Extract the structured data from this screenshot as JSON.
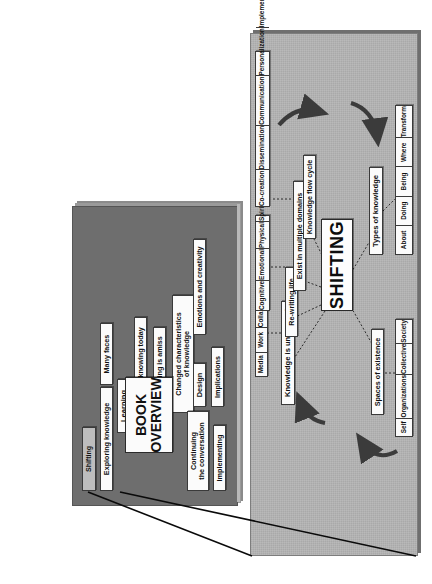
{
  "figure": {
    "type": "slide-zoom-callout",
    "orientation": "rotated-90-ccw",
    "colors": {
      "slide1_background": "#6e6e6e",
      "slide2_background": "#a9a9a9",
      "box_fill": "#fbfbfb",
      "highlight_fill": "#bdbdbd",
      "arrow": "#3a3a3a",
      "callout_line": "#0a0a0a",
      "page_background": "#ffffff"
    }
  },
  "slide_overview": {
    "title_line1": "BOOK",
    "title_line2": "OVERVIEW",
    "highlighted_item": "Shifting",
    "items_top": [
      "Exploring knowledge",
      "Many faces",
      "Learning",
      "In relation to knowing today",
      "Something is amiss"
    ],
    "item_changed_line1": "Changed characteristics",
    "item_changed_line2": "of knowledge",
    "items_bottom": [
      "Continuing",
      "the conversation",
      "Implementing",
      "Design",
      "Implications",
      "Emotions and creativity"
    ],
    "item_continuing_line1": "Continuing",
    "item_continuing_line2": "the conversation",
    "item_implementing": "Implementing",
    "item_design": "Design",
    "item_implications": "Implications",
    "item_emotions": "Emotions and creativity"
  },
  "slide_shifting": {
    "center": "SHIFTING",
    "branches": [
      {
        "label": "Knowledge is unmoored"
      },
      {
        "label": "Re-writing life"
      },
      {
        "label": "Exist in multiple domains"
      },
      {
        "label": "Knowledge flow cycle"
      },
      {
        "label": "Spaces of existence"
      },
      {
        "label": "Types of knowledge"
      }
    ],
    "branch_knowledge_unmoored": "Knowledge is unmoored",
    "branch_rewriting_life": "Re-writing life",
    "branch_exist_domains": "Exist in multiple domains",
    "branch_flow_cycle": "Knowledge flow cycle",
    "branch_spaces": "Spaces of existence",
    "branch_types": "Types of knowledge",
    "list_rewriting_life": [
      "Media",
      "Work",
      "Collaboration"
    ],
    "list_multiple_domains": [
      "Cognitive",
      "Emotional",
      "Physical",
      "Spiritual"
    ],
    "list_flow_cycle": [
      "Co-creation",
      "Dissemination",
      "Communication",
      "Personalization",
      "Implementation"
    ],
    "list_spaces_of_existence": [
      "Self",
      "Organizations",
      "Collective",
      "Society"
    ],
    "list_types_of_knowledge": [
      "About",
      "Doing",
      "Being",
      "Where",
      "Transform"
    ],
    "arrows": [
      {
        "name": "arrow-top-right-down",
        "direction": "down"
      },
      {
        "name": "arrow-bottom-right-down-left",
        "direction": "down-left"
      },
      {
        "name": "arrow-bottom-left-up",
        "direction": "up"
      },
      {
        "name": "arrow-top-left-up",
        "direction": "up"
      }
    ]
  }
}
